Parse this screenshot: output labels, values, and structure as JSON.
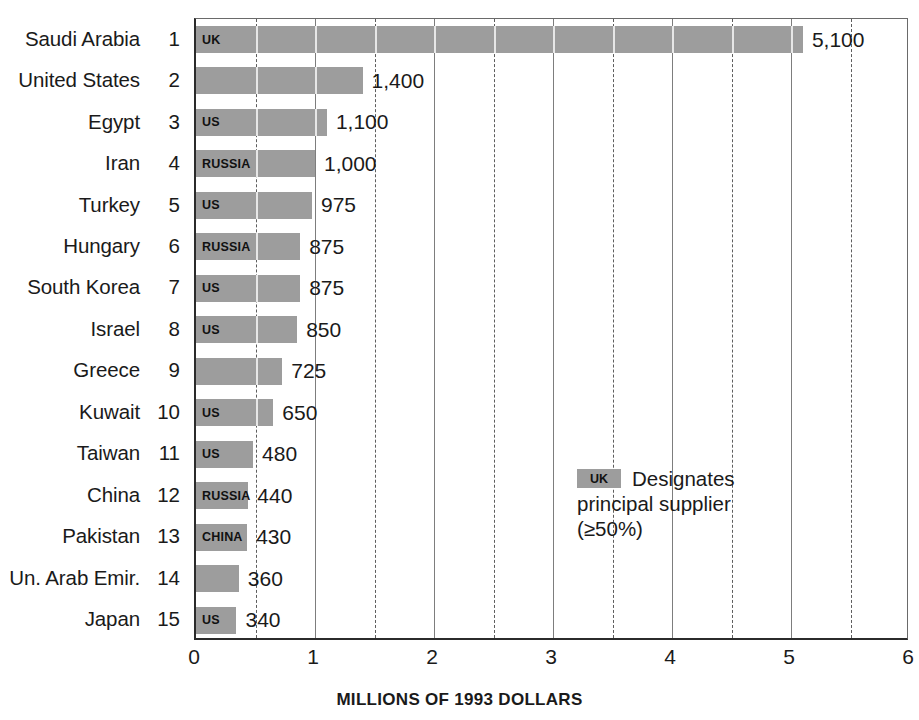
{
  "chart_data": {
    "type": "bar",
    "orientation": "horizontal",
    "title": "",
    "xlabel": "MILLIONS OF 1993 DOLLARS",
    "ylabel": "",
    "xlim": [
      0,
      6
    ],
    "xticks": [
      0,
      1,
      2,
      3,
      4,
      5,
      6
    ],
    "xtick_labels": [
      "0",
      "1",
      "2",
      "3",
      "4",
      "5",
      "6"
    ],
    "gridlines": [
      0.5,
      1.0,
      1.5,
      2.0,
      2.5,
      3.0,
      3.5,
      4.0,
      4.5,
      5.0,
      5.5
    ],
    "grid": true,
    "value_unit": "millions of 1993 dollars",
    "value_scale_note": "bar value labels are shown in the chart's own units; bar length = value/1000 on the 0-6 axis",
    "categories": [
      "Saudi Arabia",
      "United States",
      "Egypt",
      "Iran",
      "Turkey",
      "Hungary",
      "South Korea",
      "Israel",
      "Greece",
      "Kuwait",
      "Taiwan",
      "China",
      "Pakistan",
      "Un. Arab Emir.",
      "Japan"
    ],
    "values": [
      5100,
      1400,
      1100,
      1000,
      975,
      875,
      875,
      850,
      725,
      650,
      480,
      440,
      430,
      360,
      340
    ],
    "value_labels": [
      "5,100",
      "1,400",
      "1,100",
      "1,000",
      "975",
      "875",
      "875",
      "850",
      "725",
      "650",
      "480",
      "440",
      "430",
      "360",
      "340"
    ],
    "ranks": [
      "1",
      "2",
      "3",
      "4",
      "5",
      "6",
      "7",
      "8",
      "9",
      "10",
      "11",
      "12",
      "13",
      "14",
      "15"
    ],
    "suppliers": [
      "UK",
      "",
      "US",
      "RUSSIA",
      "US",
      "RUSSIA",
      "US",
      "US",
      "",
      "US",
      "US",
      "RUSSIA",
      "CHINA",
      "",
      "US"
    ],
    "bar_color": "#9d9d9d",
    "axis_color": "#2b2b2b",
    "grid_color": "#7d7d7d"
  },
  "rows": [
    {
      "rank": "1",
      "name": "Saudi Arabia",
      "value": 5100,
      "label": "5,100",
      "supplier": "UK"
    },
    {
      "rank": "2",
      "name": "United States",
      "value": 1400,
      "label": "1,400",
      "supplier": ""
    },
    {
      "rank": "3",
      "name": "Egypt",
      "value": 1100,
      "label": "1,100",
      "supplier": "US"
    },
    {
      "rank": "4",
      "name": "Iran",
      "value": 1000,
      "label": "1,000",
      "supplier": "RUSSIA"
    },
    {
      "rank": "5",
      "name": "Turkey",
      "value": 975,
      "label": "975",
      "supplier": "US"
    },
    {
      "rank": "6",
      "name": "Hungary",
      "value": 875,
      "label": "875",
      "supplier": "RUSSIA"
    },
    {
      "rank": "7",
      "name": "South Korea",
      "value": 875,
      "label": "875",
      "supplier": "US"
    },
    {
      "rank": "8",
      "name": "Israel",
      "value": 850,
      "label": "850",
      "supplier": "US"
    },
    {
      "rank": "9",
      "name": "Greece",
      "value": 725,
      "label": "725",
      "supplier": ""
    },
    {
      "rank": "10",
      "name": "Kuwait",
      "value": 650,
      "label": "650",
      "supplier": "US"
    },
    {
      "rank": "11",
      "name": "Taiwan",
      "value": 480,
      "label": "480",
      "supplier": "US"
    },
    {
      "rank": "12",
      "name": "China",
      "value": 440,
      "label": "440",
      "supplier": "RUSSIA"
    },
    {
      "rank": "13",
      "name": "Pakistan",
      "value": 430,
      "label": "430",
      "supplier": "CHINA"
    },
    {
      "rank": "14",
      "name": "Un. Arab Emir.",
      "value": 360,
      "label": "360",
      "supplier": ""
    },
    {
      "rank": "15",
      "name": "Japan",
      "value": 340,
      "label": "340",
      "supplier": "US"
    }
  ],
  "legend": {
    "swatch_label": "UK",
    "line1": "Designates",
    "line2": "principal supplier",
    "line3": "(≥50%)"
  },
  "axis": {
    "title": "MILLIONS OF 1993 DOLLARS",
    "ticks": [
      "0",
      "1",
      "2",
      "3",
      "4",
      "5",
      "6"
    ]
  }
}
